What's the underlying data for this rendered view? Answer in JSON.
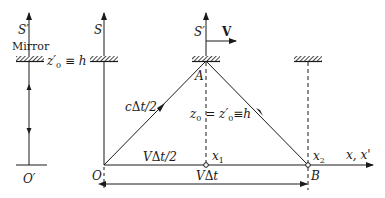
{
  "diagram": {
    "left_frame": {
      "axis_label": "S'",
      "mirror_label": "Mirror",
      "height_label": "z'0 ≡ h",
      "origin_label": "O'"
    },
    "main_frame": {
      "s_axis_label": "S",
      "s_prime_axis_label": "S'",
      "velocity_label": "V",
      "point_a": "A",
      "point_b": "B",
      "origin": "O",
      "x1_label": "x1",
      "x2_label": "x2",
      "x_axis_label": "x, x'",
      "light_path_label": "cΔt/2",
      "half_distance_label": "VΔt/2",
      "height_equation": "z0 = z'0 ≡ h",
      "full_distance_label": "VΔt"
    },
    "colors": {
      "line": "#1a1a1a",
      "background": "#ffffff"
    }
  }
}
